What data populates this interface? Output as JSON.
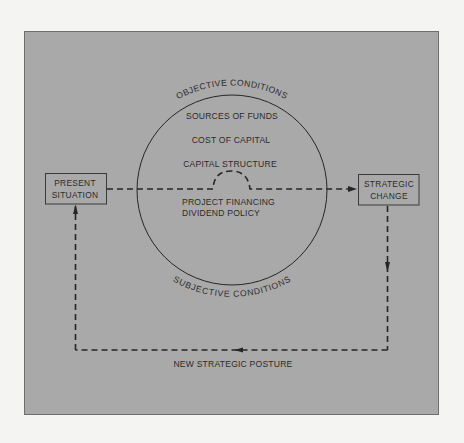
{
  "diagram": {
    "background_color": "#f4f4f2",
    "panel_color": "#a9a9a9",
    "line_color": "#262626",
    "circle": {
      "top_arc_label": "OBJECTIVE CONDITIONS",
      "bottom_arc_label": "SUBJECTIVE CONDITIONS",
      "items_above_line": [
        "SOURCES OF FUNDS",
        "COST OF CAPITAL",
        "CAPITAL STRUCTURE"
      ],
      "items_below_line": [
        "PROJECT FINANCING",
        "DIVIDEND POLICY"
      ]
    },
    "nodes": {
      "present_situation": {
        "line1": "PRESENT",
        "line2": "SITUATION"
      },
      "strategic_change": {
        "line1": "STRATEGIC",
        "line2": "CHANGE"
      }
    },
    "feedback_loop_label": "NEW STRATEGIC POSTURE",
    "flow": [
      {
        "from": "PRESENT SITUATION",
        "to": "STRATEGIC CHANGE",
        "via": "circle",
        "direction": "right"
      },
      {
        "from": "STRATEGIC CHANGE",
        "to": "NEW STRATEGIC POSTURE",
        "direction": "down-left"
      },
      {
        "from": "NEW STRATEGIC POSTURE",
        "to": "PRESENT SITUATION",
        "direction": "up"
      }
    ]
  }
}
